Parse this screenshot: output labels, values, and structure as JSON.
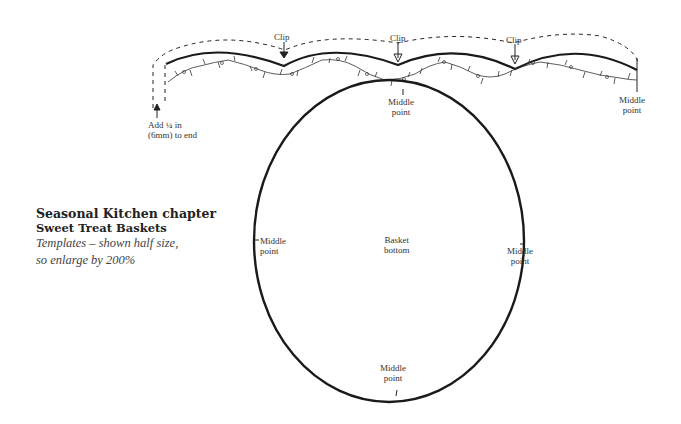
{
  "title_block": {
    "chapter": "Seasonal Kitchen chapter",
    "project": "Sweet Treat Baskets",
    "note_line1": "Templates – shown half size,",
    "note_line2": "so enlarge by 200%"
  },
  "strip_labels": {
    "clip_1": "Clip",
    "clip_2": "Clip",
    "clip_3": "Clip",
    "add_line1": "Add ¼ in",
    "add_line2": "(6mm) to end",
    "middle_center_line1": "Middle",
    "middle_center_line2": "point",
    "middle_right_line1": "Middle",
    "middle_right_line2": "point"
  },
  "circle_labels": {
    "center_line1": "Basket",
    "center_line2": "bottom",
    "left_line1": "Middle",
    "left_line2": "point",
    "right_line1": "Middle",
    "right_line2": "point",
    "bottom_line1": "Middle",
    "bottom_line2": "point"
  },
  "colors": {
    "stroke": "#1a1a1a",
    "text": "#333333"
  }
}
